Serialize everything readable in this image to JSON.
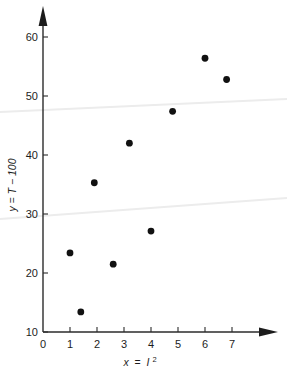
{
  "chart_data": {
    "type": "scatter",
    "title": "",
    "xlabel": "x = I²",
    "ylabel": "y = T − 100",
    "xlim": [
      0,
      7.6
    ],
    "ylim": [
      10,
      62
    ],
    "grid": false,
    "legend": null,
    "xticks": [
      "0",
      "1",
      "2",
      "3",
      "4",
      "5",
      "6",
      "7"
    ],
    "xtick_values": [
      0,
      1,
      2,
      3,
      4,
      5,
      6,
      7
    ],
    "yticks": [
      "10",
      "20",
      "30",
      "40",
      "50",
      "60"
    ],
    "ytick_values": [
      10,
      20,
      30,
      40,
      50,
      60
    ],
    "marker": "filled-circle",
    "marker_color": "#111111",
    "points": [
      {
        "x": 1.0,
        "y": 23.4
      },
      {
        "x": 1.4,
        "y": 13.4
      },
      {
        "x": 1.9,
        "y": 35.3
      },
      {
        "x": 2.6,
        "y": 21.5
      },
      {
        "x": 3.2,
        "y": 42.0
      },
      {
        "x": 4.0,
        "y": 27.1
      },
      {
        "x": 4.8,
        "y": 47.4
      },
      {
        "x": 6.0,
        "y": 56.4
      },
      {
        "x": 6.8,
        "y": 52.8
      }
    ]
  },
  "axes": {
    "x_label_parts": {
      "var": "x",
      "equals": "=",
      "term": "I",
      "exponent": "2"
    },
    "y_label_text": "y = T − 100",
    "x_arrow": "right-arrow",
    "y_arrow": "up-arrow"
  },
  "artifacts": {
    "lines": [
      {
        "name": "scan-streak-upper",
        "x1": 0,
        "y1": 112,
        "x2": 287,
        "y2": 99
      },
      {
        "name": "scan-streak-lower",
        "x1": 0,
        "y1": 219,
        "x2": 287,
        "y2": 198
      }
    ],
    "color": "#ececec"
  }
}
